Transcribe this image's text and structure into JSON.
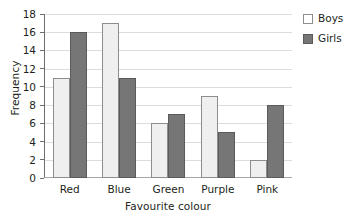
{
  "chart_data": {
    "type": "bar",
    "title": "",
    "xlabel": "Favourite colour",
    "ylabel": "Frequency",
    "categories": [
      "Red",
      "Blue",
      "Green",
      "Purple",
      "Pink"
    ],
    "series": [
      {
        "name": "Boys",
        "values": [
          11,
          17,
          6,
          9,
          2
        ],
        "color": "#efefef"
      },
      {
        "name": "Girls",
        "values": [
          16,
          11,
          7,
          5,
          8
        ],
        "color": "#767676"
      }
    ],
    "ylim": [
      0,
      18
    ],
    "ytick_step": 2,
    "yticks": [
      0,
      2,
      4,
      6,
      8,
      10,
      12,
      14,
      16,
      18
    ],
    "ytick_labels": [
      "0",
      "2",
      "4",
      "6",
      "8",
      "10",
      "12",
      "14",
      "16",
      "18"
    ],
    "grid": true,
    "grid_axis": "y",
    "grid_color": "#dcdcdc",
    "legend_position": "right-top",
    "legend_entries": [
      "Boys",
      "Girls"
    ],
    "background": "#ffffff",
    "axis_color": "#6f6f6f"
  }
}
